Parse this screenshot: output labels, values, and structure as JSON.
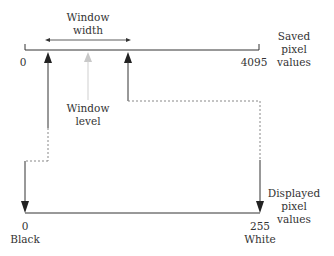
{
  "diagram": {
    "top_axis": {
      "start_label": "0",
      "end_label": "4095",
      "caption": [
        "Saved",
        "pixel",
        "values"
      ]
    },
    "window_width": {
      "label": [
        "Window",
        "width"
      ]
    },
    "window_level": {
      "label": [
        "Window",
        "level"
      ]
    },
    "bottom_axis": {
      "start_value": "0",
      "start_name": "Black",
      "end_value": "255",
      "end_name": "White",
      "caption": [
        "Displayed",
        "pixel",
        "values"
      ]
    },
    "colors": {
      "line": "#333333",
      "window_level_arrow": "#c8c8c8",
      "dashed": "#888888"
    }
  }
}
